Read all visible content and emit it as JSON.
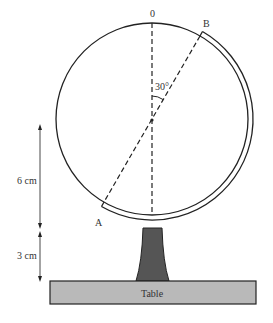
{
  "diagram": {
    "labels": {
      "top": "0",
      "point_b": "B",
      "point_a": "A",
      "angle": "30°",
      "dim_upper": "6 cm",
      "dim_lower": "3 cm",
      "table": "Table"
    },
    "geometry": {
      "circle_center": [
        152,
        119
      ],
      "circle_radius": 96,
      "angle_from_vertical_deg": 30
    },
    "colors": {
      "stroke": "#222222",
      "stand_fill": "#555555",
      "table_fill": "#b9b9b9",
      "text": "#333333"
    }
  }
}
